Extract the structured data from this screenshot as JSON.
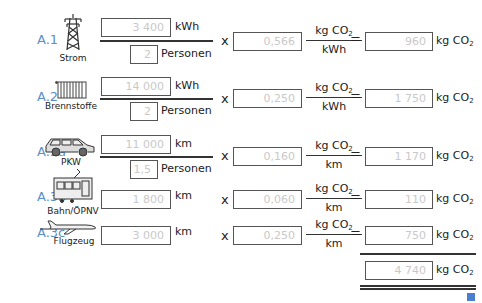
{
  "rows": [
    {
      "id": "A.1",
      "category": "Strom",
      "icon": "power-pylon-icon",
      "amount": "3 400",
      "amount_unit": "kWh",
      "persons": "2",
      "persons_unit": "Personen",
      "factor": "0,566",
      "factor_num": "kg CO",
      "factor_den": "kWh",
      "result": "960",
      "result_unit": "kg CO"
    },
    {
      "id": "A.2",
      "category": "Brennstoffe",
      "icon": "radiator-icon",
      "amount": "14 000",
      "amount_unit": "kWh",
      "persons": "2",
      "persons_unit": "Personen",
      "factor": "0,250",
      "factor_num": "kg CO",
      "factor_den": "kWh",
      "result": "1 750",
      "result_unit": "kg CO"
    },
    {
      "id": "A.3a",
      "category": "PKW",
      "icon": "car-icon",
      "amount": "11 000",
      "amount_unit": "km",
      "persons": "1,5",
      "persons_unit": "Personen",
      "factor": "0,160",
      "factor_num": "kg CO",
      "factor_den": "km",
      "result": "1 170",
      "result_unit": "kg CO"
    },
    {
      "id": "A.3b",
      "category": "Bahn/ÖPNV",
      "icon": "tram-icon",
      "amount": "1 800",
      "amount_unit": "km",
      "factor": "0,060",
      "factor_num": "kg CO",
      "factor_den": "km",
      "result": "110",
      "result_unit": "kg CO"
    },
    {
      "id": "A.3c",
      "category": "Flugzeug",
      "icon": "airplane-icon",
      "amount": "3 000",
      "amount_unit": "km",
      "factor": "0,250",
      "factor_num": "kg CO",
      "factor_den": "km",
      "result": "750",
      "result_unit": "kg CO"
    }
  ],
  "operators": {
    "multiply": "x",
    "equals": "="
  },
  "subscript": "2",
  "total": {
    "value": "4 740",
    "unit": "kg CO"
  },
  "colors": {
    "label": "#5b8fc9",
    "corner_marker": "#4a7fd0",
    "value_text": "#c9c9c9"
  }
}
